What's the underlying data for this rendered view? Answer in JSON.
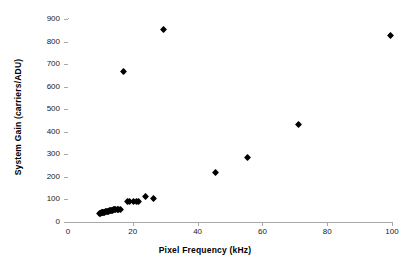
{
  "chart_data": {
    "type": "scatter",
    "title": "",
    "xlabel": "Pixel Frequency (kHz)",
    "ylabel": "System Gain (carriers/ADU)",
    "xlim": [
      0,
      100
    ],
    "ylim": [
      0,
      900
    ],
    "xticks": [
      0,
      20,
      40,
      60,
      80,
      100
    ],
    "yticks": [
      0,
      100,
      200,
      300,
      400,
      500,
      600,
      700,
      800,
      900
    ],
    "grid": false,
    "legend": false,
    "marker": "diamond",
    "marker_color": "#000000",
    "axis_color": "#a8a8a8",
    "series": [
      {
        "name": "System Gain",
        "points": [
          [
            9.6,
            38
          ],
          [
            9.9,
            39
          ],
          [
            10.2,
            40
          ],
          [
            10.5,
            41
          ],
          [
            10.8,
            42
          ],
          [
            11.1,
            43
          ],
          [
            11.4,
            44
          ],
          [
            11.7,
            45
          ],
          [
            12.0,
            46
          ],
          [
            12.3,
            47
          ],
          [
            12.6,
            48
          ],
          [
            12.9,
            50
          ],
          [
            13.2,
            51
          ],
          [
            13.5,
            52
          ],
          [
            13.8,
            53
          ],
          [
            14.1,
            54
          ],
          [
            14.4,
            55
          ],
          [
            14.8,
            56
          ],
          [
            15.2,
            57
          ],
          [
            15.7,
            57
          ],
          [
            16.2,
            56
          ],
          [
            17.0,
            668
          ],
          [
            18.3,
            89
          ],
          [
            19.0,
            89
          ],
          [
            20.2,
            92
          ],
          [
            21.0,
            89
          ],
          [
            21.7,
            89
          ],
          [
            23.8,
            112
          ],
          [
            26.3,
            106
          ],
          [
            29.4,
            855
          ],
          [
            45.5,
            221
          ],
          [
            55.4,
            285
          ],
          [
            71.2,
            434
          ],
          [
            99.6,
            826
          ]
        ]
      }
    ]
  },
  "axis": {
    "x_tick_labels": [
      "0",
      "20",
      "40",
      "60",
      "80",
      "100"
    ],
    "y_tick_labels": [
      "0",
      "100",
      "200",
      "300",
      "400",
      "500",
      "600",
      "700",
      "800",
      "900"
    ]
  }
}
